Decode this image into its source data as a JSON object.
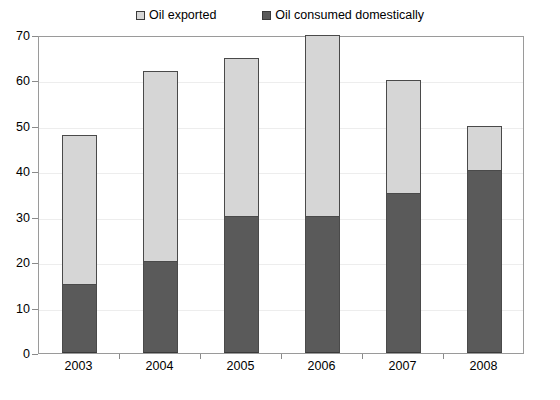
{
  "legend": {
    "entries": [
      {
        "label": "Oil exported",
        "swatch": "legend-swatch-exported",
        "color": "#d6d6d6"
      },
      {
        "label": "Oil consumed domestically",
        "swatch": "legend-swatch-domestic",
        "color": "#5a5a5a"
      }
    ]
  },
  "axes": {
    "y_ticks": [
      "0",
      "10",
      "20",
      "30",
      "40",
      "50",
      "60",
      "70"
    ],
    "x_ticks": [
      "2003",
      "2004",
      "2005",
      "2006",
      "2007",
      "2008"
    ]
  },
  "chart_data": {
    "type": "bar",
    "stacked": true,
    "title": "",
    "subtitle": "",
    "xlabel": "",
    "ylabel": "",
    "categories": [
      "2003",
      "2004",
      "2005",
      "2006",
      "2007",
      "2008"
    ],
    "series": [
      {
        "name": "Oil consumed domestically",
        "color": "#5a5a5a",
        "values": [
          15,
          20,
          30,
          30,
          35,
          40
        ]
      },
      {
        "name": "Oil exported",
        "color": "#d6d6d6",
        "values": [
          33,
          42,
          35,
          40,
          25,
          10
        ]
      }
    ],
    "totals": [
      48,
      62,
      65,
      70,
      60,
      50
    ],
    "ylim": [
      0,
      70
    ],
    "ytick_step": 10,
    "grid": true,
    "legend_position": "top"
  }
}
